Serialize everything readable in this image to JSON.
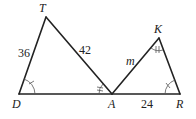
{
  "diagram": {
    "type": "similar-triangles",
    "triangles": [
      {
        "name": "TDA",
        "vertices": {
          "T": {
            "label": "T",
            "x": 46,
            "y": 17
          },
          "D": {
            "label": "D",
            "x": 19,
            "y": 94
          },
          "A": {
            "label": "A",
            "x": 112,
            "y": 94
          }
        },
        "sides": [
          {
            "between": "T-D",
            "label": "36"
          },
          {
            "between": "T-A",
            "label": "42"
          }
        ]
      },
      {
        "name": "KAR",
        "vertices": {
          "K": {
            "label": "K",
            "x": 159,
            "y": 38
          },
          "A": {
            "label": "A",
            "x": 112,
            "y": 94
          },
          "R": {
            "label": "R",
            "x": 180,
            "y": 94
          }
        },
        "sides": [
          {
            "between": "A-K",
            "label": "m"
          },
          {
            "between": "A-R",
            "label": "24"
          }
        ]
      }
    ],
    "angle_marks": [
      {
        "vertex": "D",
        "ticks": 1
      },
      {
        "vertex": "R",
        "ticks": 1
      },
      {
        "vertex": "A (triangle TDA)",
        "ticks": 2
      },
      {
        "vertex": "K",
        "ticks": 2
      }
    ],
    "labels": {
      "T": "T",
      "D": "D",
      "A": "A",
      "K": "K",
      "R": "R",
      "side_TD": "36",
      "side_TA": "42",
      "side_AK": "m",
      "side_AR": "24"
    }
  }
}
